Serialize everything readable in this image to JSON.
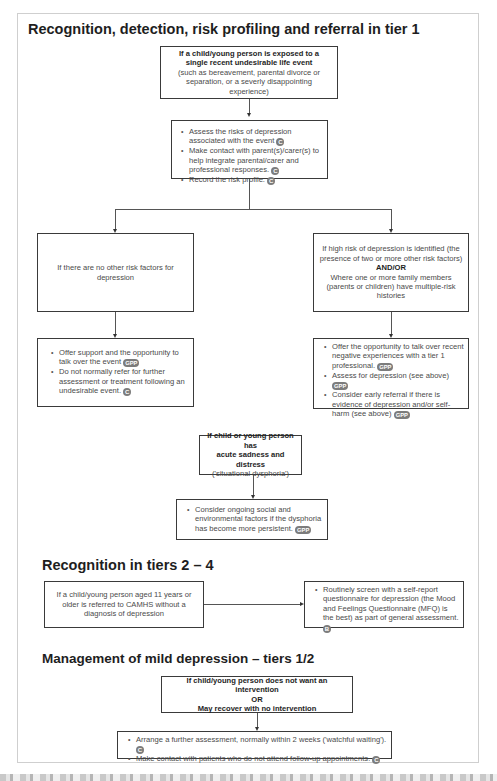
{
  "sections": {
    "tier1": {
      "title": "Recognition, detection, risk profiling and referral in tier 1",
      "start_box": {
        "line1": "If a child/young person is exposed to a",
        "line2": "single recent undesirable life event",
        "detail": "(such as bereavement, parental divorce or separation, or a severly disappointing experience)"
      },
      "assess_box": {
        "items": [
          {
            "text": "Assess the risks of depression associated with the event",
            "badge": "C"
          },
          {
            "text": "Make contact with parent(s)/carer(s) to help integrate parental/carer and professional responses.",
            "badge": "C"
          },
          {
            "text": "Record the risk profile.",
            "badge": "C"
          }
        ]
      },
      "left_branch": {
        "condition": "If there are no other risk factors for depression",
        "actions": [
          {
            "text": "Offer support and the opportunity to talk over the event",
            "badge": "GPP"
          },
          {
            "text": "Do not normally refer for further assessment or treatment following an undesirable event.",
            "badge": "C"
          }
        ]
      },
      "right_branch": {
        "condition_a": "If high risk of depression is identified (the presence of two or more other risk factors)",
        "connector": "AND/OR",
        "condition_b": "Where one or more family members (parents or children) have multiple-risk histories",
        "actions": [
          {
            "text": "Offer the opportunity to talk over recent negative experiences with a tier 1 professional.",
            "badge": "GPP"
          },
          {
            "text": "Assess for depression (see above)",
            "badge": "GPP"
          },
          {
            "text": "Consider early referral if there is evidence of depression and/or self-harm (see above)",
            "badge": "GPP"
          }
        ]
      },
      "dysphoria_box": {
        "line1": "If child or young person has",
        "line2": "acute sadness and distress",
        "detail": "('situational dysphoria')"
      },
      "dysphoria_action": {
        "items": [
          {
            "text": "Consider ongoing social and environmental factors if the dysphoria has become more persistent.",
            "badge": "GPP"
          }
        ]
      }
    },
    "tiers2_4": {
      "title": "Recognition in tiers 2 – 4",
      "condition": "If a child/young person aged 11 years or older is referred to CAMHS without a diagnosis of depression",
      "action": {
        "text": "Routinely screen with a self-report questionnaire for depression (the Mood and Feelings Questionnaire (MFQ) is the best) as part of general assessment.",
        "badge": "B"
      }
    },
    "mild": {
      "title": "Management of mild depression – tiers 1/2",
      "condition_a": "If child/young person does not want an intervention",
      "connector": "OR",
      "condition_b": "May recover with no intervention",
      "actions": [
        {
          "text": "Arrange a further assessment, normally within 2 weeks ('watchful waiting').",
          "badge": "C"
        },
        {
          "text": "Make contact with patients who do not attend follow-up appointments.",
          "badge": "C"
        }
      ]
    }
  }
}
